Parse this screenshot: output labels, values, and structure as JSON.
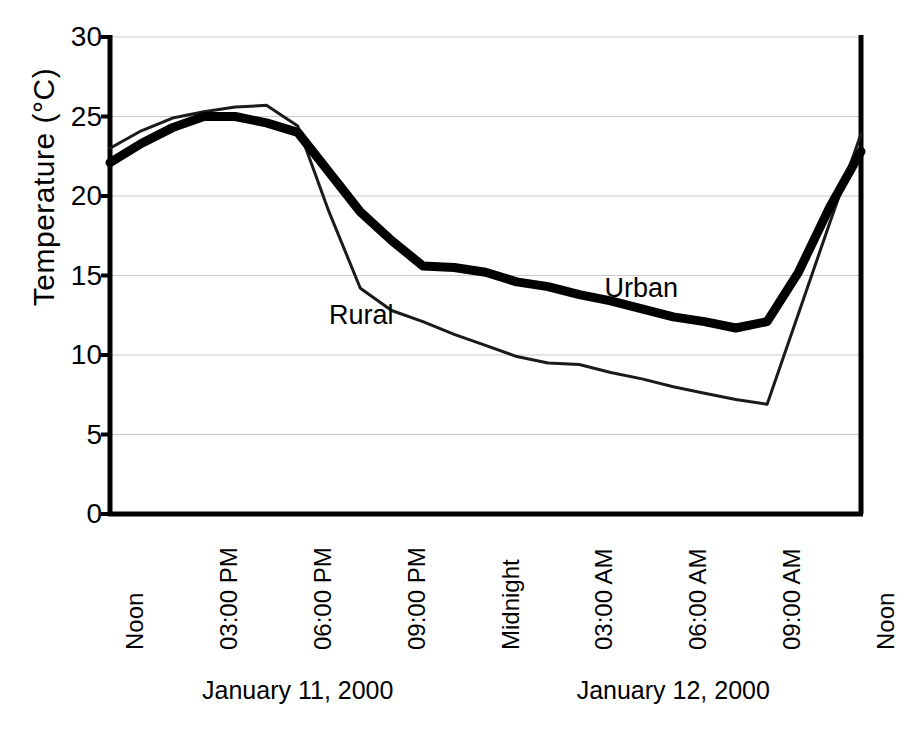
{
  "chart_data": {
    "type": "line",
    "title": "",
    "xlabel": "",
    "ylabel": "Temperature (°C)",
    "ylim": [
      0,
      30
    ],
    "yticks": [
      0,
      5,
      10,
      15,
      20,
      25,
      30
    ],
    "ytick_labels": [
      "0",
      "5",
      "10",
      "15",
      "20",
      "25",
      "30"
    ],
    "grid": "horizontal",
    "legend_position": "inline-annotation",
    "x_tick_labels": [
      "Noon",
      "03:00 PM",
      "06:00 PM",
      "09:00 PM",
      "Midnight",
      "03:00 AM",
      "06:00 AM",
      "09:00 AM",
      "Noon"
    ],
    "x_tick_hours": [
      12,
      15,
      18,
      21,
      24,
      27,
      30,
      33,
      36
    ],
    "date_groups": [
      {
        "label": "January 11, 2000",
        "center_hour": 18
      },
      {
        "label": "January 12, 2000",
        "center_hour": 30
      }
    ],
    "series": [
      {
        "name": "Urban",
        "style": "thick-black",
        "color": "#000000",
        "width": 9,
        "label_hour": 27.8,
        "label_value": 14.1,
        "x": [
          12,
          13,
          14,
          15,
          16,
          17,
          18,
          19,
          20,
          21,
          22,
          23,
          24,
          25,
          26,
          27,
          28,
          29,
          30,
          31,
          32,
          33,
          34,
          35,
          36
        ],
        "values": [
          22.1,
          23.3,
          24.3,
          25.0,
          25.0,
          24.6,
          24.0,
          21.5,
          19.0,
          17.2,
          15.6,
          15.5,
          15.2,
          14.6,
          14.3,
          13.8,
          13.4,
          12.9,
          12.4,
          12.1,
          11.7,
          12.1,
          15.2,
          19.3,
          22.8
        ]
      },
      {
        "name": "Rural",
        "style": "thin-black",
        "color": "#1a1a1a",
        "width": 3,
        "label_hour": 19.0,
        "label_value": 12.4,
        "x": [
          12,
          13,
          14,
          15,
          16,
          17,
          18,
          19,
          20,
          21,
          22,
          23,
          24,
          25,
          26,
          27,
          28,
          29,
          30,
          31,
          32,
          33,
          34,
          35,
          36
        ],
        "values": [
          23.0,
          24.1,
          24.9,
          25.3,
          25.6,
          25.7,
          24.4,
          19.0,
          14.2,
          12.8,
          12.1,
          11.3,
          10.6,
          9.9,
          9.5,
          9.4,
          8.9,
          8.5,
          8.0,
          7.6,
          7.2,
          6.9,
          12.6,
          18.3,
          23.9
        ]
      }
    ],
    "annotations": [
      {
        "text": "Urban",
        "hour": 27.8,
        "value": 14.1
      },
      {
        "text": "Rural",
        "hour": 19.0,
        "value": 12.4
      }
    ],
    "axes": {
      "left_px": 110,
      "right_px": 861,
      "top_px": 37,
      "bottom_px": 514,
      "x_min_hour": 12,
      "x_max_hour": 36
    }
  }
}
